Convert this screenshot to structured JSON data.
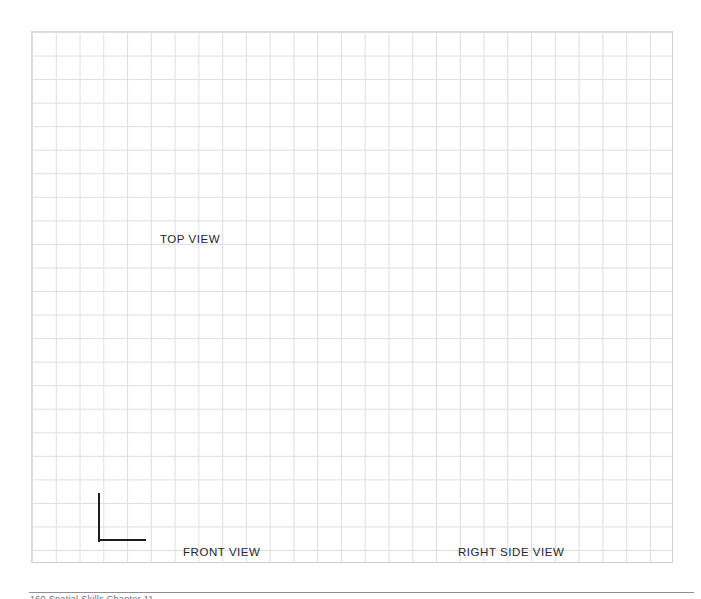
{
  "page": {
    "kind": "worksheet-page",
    "background_color": "#ffffff"
  },
  "grid": {
    "line_color": "#dddedf",
    "frame_color": "#cfd0d1",
    "cell_width_px": 23.78,
    "cell_height_px": 23.56,
    "columns": 27,
    "rows": 22,
    "left_px": 31,
    "top_px": 31,
    "width_px": 642,
    "height_px": 532
  },
  "labels": {
    "top_view": "TOP VIEW",
    "front_view": "FRONT VIEW",
    "right_side_view": "RIGHT SIDE VIEW"
  },
  "object_outline": {
    "name": "partial-front-view-outline",
    "shape": "L",
    "stroke_color": "#1c1c1c",
    "stroke_width_px": 2,
    "vertical_segment": {
      "x_px": 99,
      "y_top_px": 493,
      "y_bottom_px": 541
    },
    "horizontal_segment": {
      "y_px": 540,
      "x_left_px": 99,
      "x_right_px": 146
    }
  },
  "footer": {
    "rule_color": "#8e8f90",
    "text": "160    Spatial Skills    Chapter 11"
  }
}
